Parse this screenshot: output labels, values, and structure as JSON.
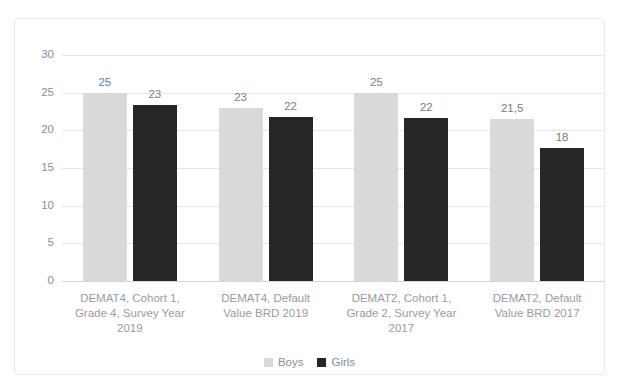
{
  "title_sliver": "Vergleich der Mittelwerte DEMAT4 und DEMAT2 nach Geschlecht",
  "legend": {
    "position": "bottom",
    "items": [
      {
        "label": "Boys",
        "color": "#d9d9d9"
      },
      {
        "label": "Girls",
        "color": "#262626"
      }
    ]
  },
  "axis": {
    "yticks": [
      "0",
      "5",
      "10",
      "15",
      "20",
      "25",
      "30"
    ]
  },
  "chart_data": {
    "type": "bar",
    "title": "",
    "subtitle": "",
    "xlabel": "",
    "ylabel": "",
    "ylim": [
      0,
      30
    ],
    "ytick_values": [
      0,
      5,
      10,
      15,
      20,
      25,
      30
    ],
    "grid": true,
    "legend_position": "bottom",
    "categories": [
      "DEMAT4, Cohort 1, Grade 4, Survey Year 2019",
      "DEMAT4, Default Value BRD 2019",
      "DEMAT2, Cohort 1, Grade 2, Survey Year 2017",
      "DEMAT2, Default Value BRD 2017"
    ],
    "category_lines": [
      [
        "DEMAT4, Cohort 1,",
        "Grade 4, Survey Year",
        "2019"
      ],
      [
        "DEMAT4, Default",
        "Value BRD 2019"
      ],
      [
        "DEMAT2, Cohort 1,",
        "Grade 2, Survey Year",
        "2017"
      ],
      [
        "DEMAT2, Default",
        "Value BRD 2017"
      ]
    ],
    "series": [
      {
        "name": "Boys",
        "color": "#d9d9d9",
        "values": [
          25,
          23,
          25,
          21.5
        ],
        "labels": [
          "25",
          "23",
          "25",
          "21,5"
        ]
      },
      {
        "name": "Girls",
        "color": "#262626",
        "values": [
          23.3,
          21.8,
          21.7,
          17.7
        ],
        "labels": [
          "23",
          "22",
          "22",
          "18"
        ]
      }
    ]
  }
}
